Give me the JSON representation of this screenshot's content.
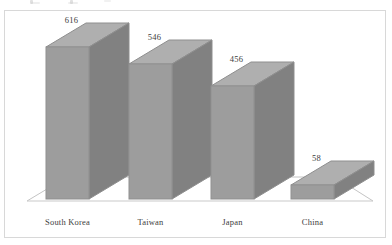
{
  "chart_data": {
    "type": "bar",
    "title": "",
    "subtitle": "",
    "xlabel": "",
    "ylabel": "",
    "categories": [
      "South Korea",
      "Taiwan",
      "Japan",
      "China"
    ],
    "values": [
      616,
      546,
      456,
      58
    ],
    "value_labels": [
      "616",
      "546",
      "456",
      "58"
    ],
    "series": [
      {
        "name": "",
        "values": [
          616,
          546,
          456,
          58
        ]
      }
    ],
    "ylim": [
      0,
      700
    ],
    "grid": false,
    "legend": null,
    "legend_position": "none",
    "style": "3d-column",
    "axis_tick_labels": [],
    "annotations": []
  },
  "colors": {
    "bar_front": "#9c9c9c",
    "bar_side": "#7f7f7f",
    "bar_top": "#aeaeae",
    "bar_outline": "#8d8d8d",
    "frame_border": "#d8d8d8",
    "floor_line": "#c4c4c4",
    "text": "#3a3a3a",
    "background": "#ffffff"
  },
  "chart": {
    "frame_label": "chart-area",
    "floor_label": "plot-floor"
  }
}
